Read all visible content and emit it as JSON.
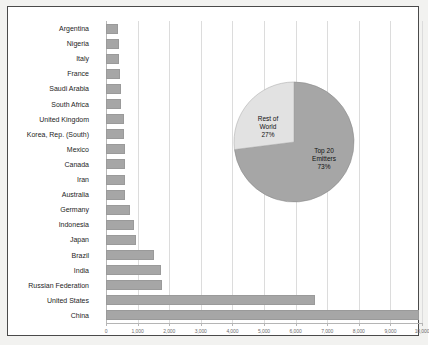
{
  "chart_data": {
    "type": "bar",
    "title": "",
    "xlabel": "",
    "ylabel": "",
    "orientation": "horizontal",
    "grid": true,
    "xlim": [
      0,
      10000
    ],
    "xticks": [
      0,
      1000,
      2000,
      3000,
      4000,
      5000,
      6000,
      7000,
      8000,
      9000,
      10000
    ],
    "xtick_labels": [
      "0",
      "1,000",
      "2,000",
      "3,000",
      "4,000",
      "5,000",
      "6,000",
      "7,000",
      "8,000",
      "9,000",
      "10,000"
    ],
    "categories": [
      "Argentina",
      "Nigeria",
      "Italy",
      "France",
      "Saudi Arabia",
      "South Africa",
      "United Kingdom",
      "Korea, Rep. (South)",
      "Mexico",
      "Canada",
      "Iran",
      "Australia",
      "Germany",
      "Indonesia",
      "Japan",
      "Brazil",
      "India",
      "Russian Federation",
      "United States",
      "China"
    ],
    "values": [
      380,
      400,
      420,
      430,
      470,
      480,
      560,
      570,
      590,
      600,
      610,
      610,
      760,
      880,
      960,
      1530,
      1750,
      1760,
      6600,
      9900
    ],
    "bar_color": "#a6a6a6",
    "grid_color": "#dcdcdc"
  },
  "pie_chart": {
    "type": "pie",
    "center_x": 61,
    "center_y": 61,
    "radius": 60,
    "slices": [
      {
        "label_line1": "Top 20",
        "label_line2": "Emitters",
        "label_line3": "73%",
        "value": 73,
        "color": "#a6a6a6"
      },
      {
        "label_line1": "Rest of",
        "label_line2": "World",
        "label_line3": "27%",
        "value": 27,
        "color": "#e2e2e2"
      }
    ]
  },
  "frame": {
    "border_color": "#4a4a4a",
    "background": "#ffffff"
  }
}
